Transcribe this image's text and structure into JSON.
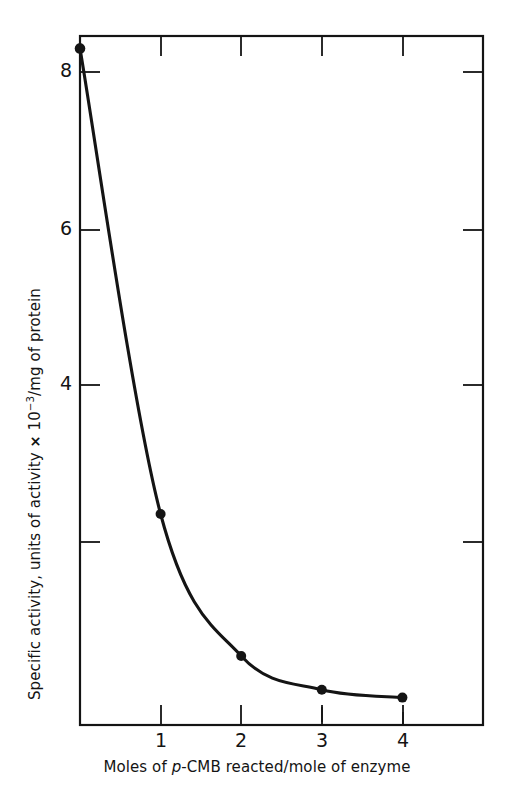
{
  "figure": {
    "background_color": "#ffffff",
    "ink_color": "#141414"
  },
  "chart_data": {
    "type": "line",
    "title": "",
    "subtitle": "",
    "xlabel_plain": "Moles of p-CMB reacted/mole of enzyme",
    "ylabel_plain": "Specific activity, units of activity x 10^-3/mg of protein",
    "xlabel_parts": {
      "before_italic": "Moles of ",
      "italic": "p",
      "after_italic": "-CMB reacted/mole of enzyme"
    },
    "ylabel_parts": {
      "before": "Specific activity, units of activity ",
      "times": "×",
      "mantissa": " 10",
      "exponent": "−3",
      "after": "/mg of protein"
    },
    "x": [
      0,
      1,
      2,
      3,
      4
    ],
    "values": [
      8.3,
      2.37,
      0.56,
      0.13,
      0.03
    ],
    "series": [
      {
        "name": "Specific activity",
        "x": [
          0,
          1,
          2,
          3,
          4
        ],
        "values": [
          8.3,
          2.37,
          0.56,
          0.13,
          0.03
        ],
        "marker": "filled-circle",
        "line_style": "solid",
        "color": "#141414"
      }
    ],
    "xlim": [
      0,
      5
    ],
    "ylim": [
      0,
      8.78
    ],
    "xticks": [
      1,
      2,
      3,
      4
    ],
    "xtick_labels": [
      "1",
      "2",
      "3",
      "4"
    ],
    "yticks": [
      4,
      6,
      8
    ],
    "ytick_labels": [
      "4",
      "6",
      "8"
    ],
    "tick_direction": "in",
    "grid": false,
    "legend": false,
    "frame": "box"
  },
  "axes": {
    "x_tick_labels": [
      {
        "text": "1",
        "px": 161
      },
      {
        "text": "2",
        "px": 241
      },
      {
        "text": "3",
        "px": 322
      },
      {
        "text": "4",
        "px": 403
      }
    ],
    "y_tick_labels": [
      {
        "text": "8",
        "py": 72
      },
      {
        "text": "6",
        "py": 230
      },
      {
        "text": "4",
        "py": 385
      }
    ]
  }
}
